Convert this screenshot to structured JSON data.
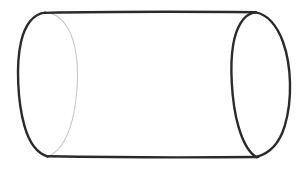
{
  "figure": {
    "kind": "geometric-line-drawing",
    "title": "",
    "caption": "",
    "background_color": "#ffffff",
    "canvas": {
      "width": 307,
      "height": 172
    },
    "strokes": {
      "outline_color": "#2b2b2b",
      "near_rim_color": "#2a2a2a",
      "far_rim_color": "#c8c8c8",
      "outline_width": 2.4,
      "near_rim_width": 2.4,
      "far_rim_width": 1.1
    },
    "fill": {
      "body_color": "#ffffff",
      "cap_color": "#ffffff"
    },
    "geometry": {
      "left_ellipse": {
        "name": "left-cap-ellipse",
        "center_x": 48,
        "center_y": 85,
        "radius_x": 30,
        "radius_y": 72.5,
        "back_arc_visible": true,
        "front_arc_visible": true,
        "front_arc_faint": true
      },
      "right_ellipse": {
        "name": "right-cap-ellipse",
        "center_x": 261,
        "center_y": 85,
        "radius_x": 29,
        "radius_y": 73,
        "back_arc_visible": true,
        "front_arc_visible": true,
        "front_arc_faint": false
      },
      "top_edge": {
        "name": "top-silhouette-line",
        "x1": 45,
        "y1": 12.5,
        "x2": 256,
        "y2": 12.0
      },
      "bottom_edge": {
        "name": "bottom-silhouette-line",
        "x1": 48,
        "y1": 156.5,
        "x2": 258,
        "y2": 157.0
      }
    },
    "labels": [],
    "annotations": []
  }
}
